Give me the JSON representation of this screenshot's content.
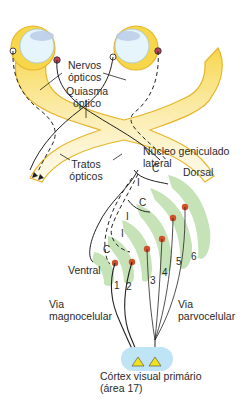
{
  "labels": {
    "optic_nerves": [
      "Nervos",
      "ópticos"
    ],
    "optic_chiasm": [
      "Quiasma",
      "óptico"
    ],
    "optic_tracts": [
      "Tratos",
      "ópticos"
    ],
    "lgn": [
      "Núcleo geniculado",
      "lateral"
    ],
    "dorsal": "Dorsal",
    "ventral": "Ventral",
    "magno": [
      "Via",
      "magnocelular"
    ],
    "parvo": [
      "Via",
      "parvocelular"
    ],
    "cortex": [
      "Córtex visual primário",
      "(área 17)"
    ]
  },
  "layer_numbers": [
    "1",
    "2",
    "3",
    "4",
    "5",
    "6"
  ],
  "input_marks": {
    "contralateral": "C",
    "ipsilateral": "I"
  },
  "colors": {
    "nerve_fill": "#f7d64a",
    "nerve_edge": "#e6b52a",
    "eye_fill": "#e6f4fb",
    "lens": "#b9cde8",
    "layer_green": "#bfe0b0",
    "cell_body": "#d2502a",
    "cortex_blue": "#bfe4f5",
    "pyramidal": "#f2e11f"
  }
}
